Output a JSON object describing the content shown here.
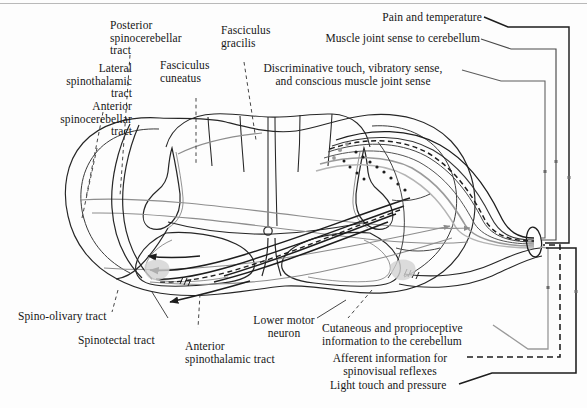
{
  "figure": {
    "type": "anatomical-diagram",
    "background_color": "#fdfdfd",
    "ink_color": "#1a1a1a",
    "gray_ink_color": "#8d8d8d"
  },
  "labels": {
    "lateral_spinothalamic_tract": "Lateral\nspinothalamic\ntract",
    "anterior_spinocerebellar_tract": "Anterior\nspinocerebellar\ntract",
    "posterior_spinocerebellar_tract": "Posterior\nspinocerebellar\ntract",
    "fasciculus_cuneatus": "Fasciculus\ncuneatus",
    "fasciculus_gracilis": "Fasciculus\ngracilis",
    "pain_and_temperature": "Pain and temperature",
    "muscle_joint_sense_to_cerebellum": "Muscle joint sense to cerebellum",
    "discriminative_touch": "Discriminative touch, vibratory sense,\nand conscious muscle joint sense",
    "spino_olivary_tract": "Spino-olivary tract",
    "spinotectal_tract": "Spinotectal tract",
    "anterior_spinothalamic_tract": "Anterior\nspinothalamic tract",
    "lower_motor_neuron": "Lower motor\nneuron",
    "cutaneous_and_proprioceptive": "Cutaneous and proprioceptive\ninformation to the cerebellum",
    "afferent_information": "Afferent information for\nspinovisual reflexes",
    "light_touch_and_pressure": "Light touch and pressure"
  },
  "icons": {
    "spinal_cord_outline": "spinal-cord-outline-icon",
    "gray_matter_butterfly": "gray-matter-butterfly-icon",
    "dorsal_root_ganglion": "dorsal-root-ganglion-icon",
    "central_canal": "central-canal-icon",
    "arrowhead": "arrowhead-icon"
  },
  "bracket_lines": {
    "pain_temperature_style": "solid",
    "muscle_joint_style": "solid",
    "discriminative_touch_style": "solid",
    "cutaneous_proprioceptive_style": "solid",
    "afferent_spinovisual_style": "dashed",
    "light_touch_style": "solid"
  }
}
